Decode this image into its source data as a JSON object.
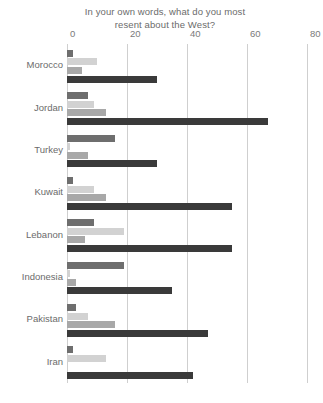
{
  "chart_data": {
    "type": "bar",
    "orientation": "horizontal",
    "title": "In your own words, what do you most resent about the West?",
    "title_line1": "In your own words, what do you most",
    "title_line2": "resent about the West?",
    "xlabel": "",
    "ylabel": "",
    "xlim": [
      0,
      80
    ],
    "xticks": [
      0,
      20,
      40,
      60,
      80
    ],
    "xtick_labels": [
      "0",
      "20",
      "40",
      "60",
      "80"
    ],
    "grid": true,
    "legend": "none",
    "categories": [
      "Morocco",
      "Jordan",
      "Turkey",
      "Kuwait",
      "Lebanon",
      "Indonesia",
      "Pakistan",
      "Iran"
    ],
    "series": [
      {
        "name": "series-1",
        "color": "#6e6e6e",
        "values": [
          2,
          7,
          16,
          2,
          9,
          19,
          3,
          2
        ]
      },
      {
        "name": "series-2",
        "color": "#d2d2d2",
        "values": [
          10,
          9,
          1,
          9,
          19,
          1,
          7,
          13
        ]
      },
      {
        "name": "series-3",
        "color": "#a8a8a8",
        "values": [
          5,
          13,
          7,
          13,
          6,
          3,
          16,
          0
        ]
      },
      {
        "name": "series-4",
        "color": "#3a3a3a",
        "values": [
          30,
          67,
          30,
          55,
          55,
          35,
          47,
          42
        ]
      }
    ]
  }
}
